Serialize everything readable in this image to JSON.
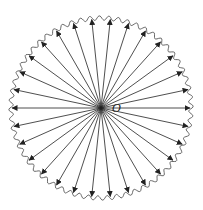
{
  "diagram": {
    "center_label": "O",
    "ray_count": 30,
    "center": [
      101,
      108
    ],
    "radius": 90,
    "colors": {
      "stroke": "#222222",
      "background": "#ffffff"
    }
  }
}
